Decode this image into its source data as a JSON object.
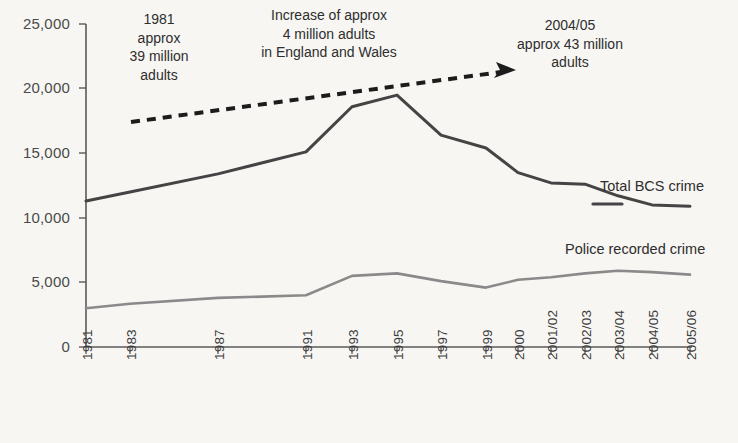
{
  "chart_data": {
    "type": "line",
    "title": "",
    "xlabel": "",
    "ylabel": "",
    "ylim": [
      0,
      25000
    ],
    "grid": false,
    "legend_position": "inline-right",
    "categories": [
      "1981",
      "1982",
      "1983",
      "1984",
      "1985",
      "1986",
      "1987",
      "1988",
      "1989",
      "1990",
      "1991",
      "1992",
      "1993",
      "1994",
      "1995",
      "1996",
      "1997",
      "1998",
      "1999",
      "2000",
      "2001/02",
      "2002/03",
      "2003/04",
      "2004/05",
      "2005/06"
    ],
    "xtick_labels": [
      "1981",
      "1983",
      "1987",
      "1991",
      "1993",
      "1995",
      "1997",
      "1999",
      "2000",
      "2001/02",
      "2002/03",
      "2003/04",
      "2004/05",
      "2005/06"
    ],
    "ytick_labels": [
      "0",
      "5,000",
      "10,000",
      "15,000",
      "20,000",
      "25,000"
    ],
    "ytick_values": [
      0,
      5000,
      10000,
      15000,
      20000,
      25000
    ],
    "series": [
      {
        "name": "Total BCS crime",
        "color": "#444444",
        "style": "solid",
        "x": [
          "1981",
          "1983",
          "1987",
          "1991",
          "1993",
          "1995",
          "1997",
          "1999",
          "2000",
          "2001/02",
          "2002/03",
          "2003/04",
          "2004/05",
          "2005/06"
        ],
        "values": [
          11300,
          12000,
          13400,
          15100,
          18600,
          19500,
          16400,
          15400,
          13500,
          12700,
          12600,
          11700,
          11000,
          10900
        ]
      },
      {
        "name": "Police recorded crime",
        "color": "#8a8a8a",
        "style": "solid",
        "x": [
          "1981",
          "1983",
          "1987",
          "1991",
          "1993",
          "1995",
          "1997",
          "1999",
          "2000",
          "2001/02",
          "2002/03",
          "2003/04",
          "2004/05",
          "2005/06"
        ],
        "values": [
          3000,
          3350,
          3800,
          4000,
          5500,
          5700,
          5100,
          4600,
          5200,
          5400,
          5700,
          5900,
          5800,
          5600
        ]
      }
    ],
    "annotations": [
      {
        "name": "left-annotation",
        "text": "1981\napprox\n39 million\nadults"
      },
      {
        "name": "center-annotation",
        "text": "Increase of approx\n4 million adults\nin England and Wales"
      },
      {
        "name": "right-annotation",
        "text": "2004/05\napprox 43 million\nadults"
      }
    ],
    "arrow": {
      "name": "growth-arrow",
      "style": "dashed-with-arrowhead",
      "color": "#1c1c1c"
    }
  },
  "colors": {
    "background": "#f7f6f3",
    "axis": "#5a5a5a",
    "bcs_line": "#444444",
    "police_line": "#8a8a8a",
    "arrow": "#1c1c1c",
    "text": "#2e2e2e"
  }
}
